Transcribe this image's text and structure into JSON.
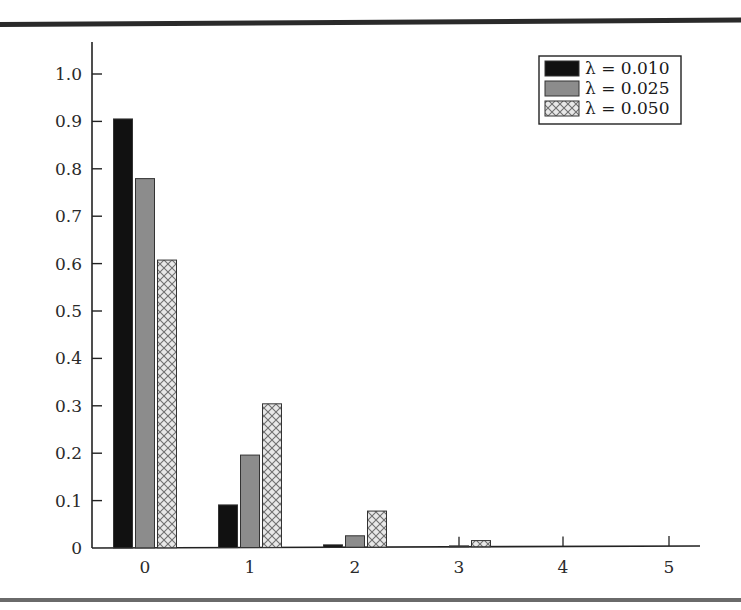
{
  "chart_data": {
    "type": "bar",
    "title": "",
    "xlabel": "",
    "ylabel": "",
    "categories": [
      "0",
      "1",
      "2",
      "3",
      "4",
      "5"
    ],
    "series": [
      {
        "name": "λ = 0.010",
        "style": "solid-black",
        "color": "#111111",
        "values": [
          0.905,
          0.09,
          0.005,
          0.0002,
          0.0,
          0.0
        ]
      },
      {
        "name": "λ = 0.025",
        "style": "solid-gray",
        "color": "#8a8a8a",
        "values": [
          0.779,
          0.195,
          0.024,
          0.002,
          0.0001,
          0.0
        ]
      },
      {
        "name": "λ = 0.050",
        "style": "crosshatch",
        "color": "#bdbdbd",
        "values": [
          0.607,
          0.303,
          0.076,
          0.013,
          0.0016,
          0.0002
        ]
      }
    ],
    "y_ticks": [
      "0",
      "0.1",
      "0.2",
      "0.3",
      "0.4",
      "0.5",
      "0.6",
      "0.7",
      "0.8",
      "0.9",
      "1.0"
    ],
    "ylim": [
      0,
      1.0
    ],
    "grid": false,
    "legend_position": "top-right"
  }
}
